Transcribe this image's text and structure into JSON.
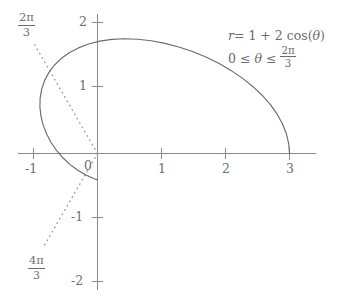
{
  "chart_data": {
    "type": "line",
    "title": "",
    "subtitle": "",
    "xlabel": "",
    "ylabel": "",
    "xlim": [
      -1.5,
      3.45
    ],
    "ylim": [
      -2.15,
      2.2
    ],
    "grid": false,
    "legend_position": "none",
    "polar_equation": "r = 1 + 2cos(theta)",
    "theta_range": [
      0,
      2.0943951
    ],
    "x_ticks": [
      -1,
      0,
      1,
      2,
      3
    ],
    "x_tick_labels": [
      "-1",
      "0",
      "1",
      "2",
      "3"
    ],
    "y_ticks": [
      -2,
      -1,
      0,
      1,
      2
    ],
    "y_tick_labels": [
      "-2",
      "-1",
      "0",
      "1",
      "2"
    ],
    "series": [
      {
        "name": "r = 1 + 2cos(theta)",
        "style": "solid",
        "color": "#6b6b6b",
        "points": [
          [
            3.0,
            0.0
          ],
          [
            2.9875,
            0.1558
          ],
          [
            2.9503,
            0.3114
          ],
          [
            2.8892,
            0.4658
          ],
          [
            2.8049,
            0.618
          ],
          [
            2.6986,
            0.7666
          ],
          [
            2.5717,
            0.9103
          ],
          [
            2.4257,
            1.0478
          ],
          [
            2.2627,
            1.1777
          ],
          [
            2.0847,
            1.2986
          ],
          [
            1.894,
            1.409
          ],
          [
            1.6931,
            1.5077
          ],
          [
            1.4845,
            1.5934
          ],
          [
            1.2709,
            1.665
          ],
          [
            1.0551,
            1.7215
          ],
          [
            0.8397,
            1.762
          ],
          [
            0.6275,
            1.786
          ],
          [
            0.4211,
            1.793
          ],
          [
            0.2229,
            1.7827
          ],
          [
            0.0355,
            1.7553
          ],
          [
            -0.1391,
            1.7109
          ],
          [
            -0.2989,
            1.6502
          ],
          [
            -0.4424,
            1.5739
          ],
          [
            -0.568,
            1.4831
          ],
          [
            -0.6746,
            1.3792
          ],
          [
            -0.7612,
            1.2637
          ],
          [
            -0.8272,
            1.1384
          ],
          [
            -0.8723,
            1.0053
          ],
          [
            -0.8964,
            0.8665
          ],
          [
            -0.8998,
            0.7243
          ],
          [
            -0.8832,
            0.581
          ],
          [
            -0.8473,
            0.4389
          ],
          [
            -0.7933,
            0.3004
          ],
          [
            -0.7226,
            0.1679
          ],
          [
            -0.6368,
            0.0434
          ],
          [
            -0.5377,
            -0.0709
          ],
          [
            -0.4272,
            -0.1735
          ],
          [
            -0.3077,
            -0.2625
          ],
          [
            -0.1813,
            -0.3367
          ],
          [
            -0.0505,
            -0.395
          ],
          [
            0.0,
            -0.4116
          ]
        ]
      }
    ],
    "rays": [
      {
        "name": "2pi/3",
        "angle_degrees": 120,
        "style": "dotted",
        "color": "#9a9a9a",
        "label": "2π/3",
        "label_numerator": "2π",
        "label_denominator": "3"
      },
      {
        "name": "4pi/3",
        "angle_degrees": 240,
        "style": "dotted",
        "color": "#9a9a9a",
        "label": "4π/3",
        "label_numerator": "4π",
        "label_denominator": "3"
      }
    ],
    "annotations": [
      {
        "name": "equation-line-1",
        "text": "r = 1 + 2 cos(θ)"
      },
      {
        "name": "equation-line-2",
        "text": "0 ≤ θ ≤ 2π/3"
      }
    ],
    "colors": {
      "axis": "#8a8a8a",
      "curve": "#6b6b6b",
      "ray": "#9a9a9a",
      "text": "#6f6f6f",
      "background": "#ffffff"
    }
  },
  "axes": {
    "x_labels": [
      "-1",
      "0",
      "1",
      "2",
      "3"
    ],
    "y_labels": [
      "2",
      "1",
      "-1",
      "-2"
    ]
  },
  "equation": {
    "r_lhs": "r",
    "r_eq": "= 1 + 2 cos(",
    "r_theta": "θ",
    "r_close": ")",
    "bound_left": "0 ≤",
    "bound_theta": "θ",
    "bound_mid": "≤",
    "frac_num": "2π",
    "frac_den": "3"
  },
  "rays": {
    "upper": {
      "num": "2π",
      "den": "3"
    },
    "lower": {
      "num": "4π",
      "den": "3"
    }
  }
}
